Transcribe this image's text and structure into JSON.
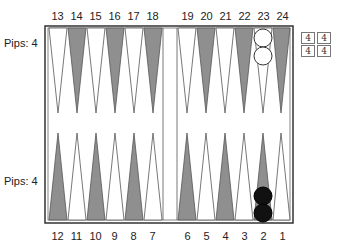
{
  "top_labels": [
    "13",
    "14",
    "15",
    "16",
    "17",
    "18",
    "19",
    "20",
    "21",
    "22",
    "23",
    "24"
  ],
  "bottom_labels": [
    "12",
    "11",
    "10",
    "9",
    "8",
    "7",
    "6",
    "5",
    "4",
    "3",
    "2",
    "1"
  ],
  "pips_top": "Pips: 4",
  "pips_bottom": "Pips: 4",
  "dice": [
    "4",
    "4",
    "4",
    "4"
  ],
  "colors": {
    "dark_point": "#8f8f8f",
    "light_point": "#ffffff",
    "frame": "#333333",
    "white_checker": "#ffffff",
    "black_checker": "#111111"
  },
  "checkers": [
    {
      "point": 23,
      "color": "white",
      "count": 2
    },
    {
      "point": 2,
      "color": "black",
      "count": 2
    }
  ],
  "caption": "Fi..."
}
